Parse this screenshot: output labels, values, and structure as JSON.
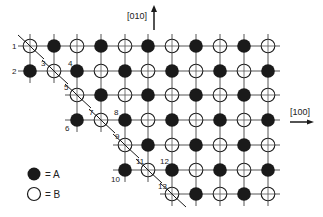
{
  "figure": {
    "type": "crystal-lattice-step-diagram",
    "colors": {
      "ink": "#1a1a1a",
      "grid": "#555555",
      "background": "#ffffff"
    },
    "grid": {
      "col_x": [
        30,
        54,
        77,
        101,
        125,
        148,
        172,
        196,
        220,
        244,
        268
      ],
      "row_y": [
        46,
        71,
        95,
        120,
        145,
        170,
        194
      ],
      "row_start_col": [
        0,
        0,
        2,
        2,
        4,
        4,
        6
      ],
      "row_end_col": 10,
      "rule": "A when (row+col) odd, B otherwise"
    },
    "slashed_sites": [
      [
        0,
        0
      ],
      [
        1,
        1
      ],
      [
        2,
        2
      ],
      [
        3,
        3
      ],
      [
        4,
        4
      ],
      [
        5,
        5
      ],
      [
        6,
        6
      ]
    ],
    "site_labels": [
      {
        "text": "1",
        "x": 12,
        "y": 49
      },
      {
        "text": "2",
        "x": 12,
        "y": 74
      },
      {
        "text": "3",
        "x": 41,
        "y": 66
      },
      {
        "text": "4",
        "x": 68,
        "y": 66
      },
      {
        "text": "5",
        "x": 64,
        "y": 90
      },
      {
        "text": "6",
        "x": 65,
        "y": 131
      },
      {
        "text": "7",
        "x": 89,
        "y": 115
      },
      {
        "text": "8",
        "x": 114,
        "y": 115
      },
      {
        "text": "9",
        "x": 115,
        "y": 139
      },
      {
        "text": "10",
        "x": 111,
        "y": 182
      },
      {
        "text": "11",
        "x": 136,
        "y": 164
      },
      {
        "text": "12",
        "x": 160,
        "y": 164
      },
      {
        "text": "13",
        "x": 158,
        "y": 189
      }
    ],
    "axes": {
      "vertical": {
        "label": "[010]",
        "label_x": 127,
        "label_y": 19,
        "arrow_x": 154,
        "arrow_y1": 30,
        "arrow_y2": 7
      },
      "horizontal": {
        "label": "[100]",
        "label_x": 290,
        "label_y": 115,
        "arrow_y": 122,
        "arrow_x1": 290,
        "arrow_x2": 313
      }
    },
    "legend": [
      {
        "symbol": "filled-circle",
        "text": "= A",
        "x": 34,
        "y": 174
      },
      {
        "symbol": "open-circle",
        "text": "= B",
        "x": 34,
        "y": 194
      }
    ]
  }
}
